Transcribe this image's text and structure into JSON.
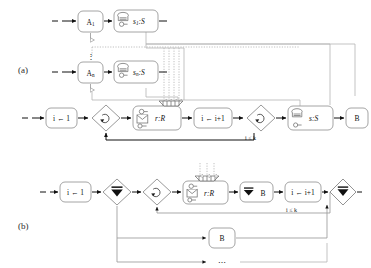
{
  "figure": {
    "panels": [
      {
        "label": "(a)"
      },
      {
        "label": "(b)"
      }
    ]
  },
  "panel_a": {
    "label": "(a)",
    "agents": [
      {
        "id": "a1",
        "name": "A",
        "subscript": "1",
        "icon": "send-envelope-icon"
      },
      {
        "id": "an",
        "name": "A",
        "subscript": "n",
        "icon": "send-envelope-icon"
      }
    ],
    "send_nodes": [
      {
        "id": "s1",
        "base": "s",
        "subscript": "1",
        "suffix": ":S",
        "icon": "send-envelope-icon"
      },
      {
        "id": "sn",
        "base": "s",
        "subscript": "n",
        "suffix": ":S",
        "icon": "send-envelope-icon"
      }
    ],
    "vertical_ellipsis": "⋮",
    "main_row": [
      {
        "id": "init",
        "kind": "box",
        "text": "i ← 1"
      },
      {
        "id": "loop-head-a",
        "kind": "diamond",
        "glyph": "loop-arrow-icon"
      },
      {
        "id": "recv-a",
        "kind": "box-icon",
        "text": "r:R",
        "icon": "receive-envelope-icon"
      },
      {
        "id": "incr",
        "kind": "box",
        "text": "i ← i+1"
      },
      {
        "id": "loop-test-a",
        "kind": "diamond",
        "glyph": "loop-arrow-icon",
        "edge_label": "i ≤ k"
      },
      {
        "id": "send-a",
        "kind": "box-icon",
        "text": "s:S",
        "icon": "send-envelope-icon"
      },
      {
        "id": "b-node-a",
        "kind": "box",
        "text": "B"
      }
    ]
  },
  "panel_b": {
    "label": "(b)",
    "main_row": [
      {
        "id": "init-b",
        "kind": "box",
        "text": "i ← 1"
      },
      {
        "id": "choice-1",
        "kind": "diamond",
        "glyph": "merge-triangle-icon"
      },
      {
        "id": "loop-head-b",
        "kind": "diamond",
        "glyph": "loop-arrow-icon"
      },
      {
        "id": "recv-b",
        "kind": "box-icon",
        "text": "r:R",
        "icon": "receive-envelope-icon"
      },
      {
        "id": "b-triangle",
        "kind": "box-glyph",
        "text": "B",
        "glyph": "merge-triangle-icon"
      },
      {
        "id": "incr-b",
        "kind": "box",
        "text": "i ← i+1"
      },
      {
        "id": "loop-test-b",
        "kind": "diamond",
        "glyph": "loop-arrow-icon",
        "edge_label": "i ≤ k"
      },
      {
        "id": "choice-2",
        "kind": "diamond",
        "glyph": "merge-triangle-icon"
      }
    ],
    "branch_rows": [
      {
        "id": "b-branch",
        "kind": "box",
        "text": "B"
      },
      {
        "id": "ellipsis-branch",
        "kind": "ellipsis",
        "text": "⋯"
      }
    ]
  },
  "colors": {
    "node_stroke": "#9a9a9a",
    "solid_edge": "#111111",
    "gray_edge": "#b4b4b4",
    "text": "#111111",
    "background": "#ffffff"
  }
}
